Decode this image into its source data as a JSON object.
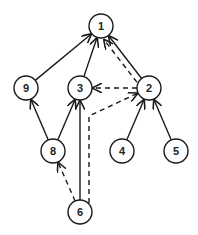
{
  "diagram": {
    "type": "directed-graph",
    "node_radius": 12,
    "stroke_color": "#1a1a1a",
    "fill_color": "#ffffff",
    "nodes": [
      {
        "id": "1",
        "label": "1",
        "x": 101,
        "y": 26
      },
      {
        "id": "9",
        "label": "9",
        "x": 26,
        "y": 88
      },
      {
        "id": "3",
        "label": "3",
        "x": 80,
        "y": 88
      },
      {
        "id": "2",
        "label": "2",
        "x": 149,
        "y": 88
      },
      {
        "id": "8",
        "label": "8",
        "x": 53,
        "y": 151
      },
      {
        "id": "4",
        "label": "4",
        "x": 122,
        "y": 151
      },
      {
        "id": "5",
        "label": "5",
        "x": 176,
        "y": 151
      },
      {
        "id": "6",
        "label": "6",
        "x": 80,
        "y": 212
      }
    ],
    "edges": [
      {
        "from": "9",
        "to": "1",
        "style": "solid"
      },
      {
        "from": "3",
        "to": "1",
        "style": "solid"
      },
      {
        "from": "2",
        "to": "1",
        "style": "solid"
      },
      {
        "from": "8",
        "to": "9",
        "style": "solid"
      },
      {
        "from": "8",
        "to": "3",
        "style": "solid"
      },
      {
        "from": "6",
        "to": "3",
        "style": "solid"
      },
      {
        "from": "4",
        "to": "2",
        "style": "solid"
      },
      {
        "from": "5",
        "to": "2",
        "style": "solid"
      },
      {
        "from": "2",
        "to": "1",
        "style": "dashed"
      },
      {
        "from": "2",
        "to": "3",
        "style": "dashed"
      },
      {
        "from": "6",
        "to": "8",
        "style": "dashed"
      },
      {
        "from": "6",
        "to": "2",
        "style": "dashed"
      }
    ]
  }
}
